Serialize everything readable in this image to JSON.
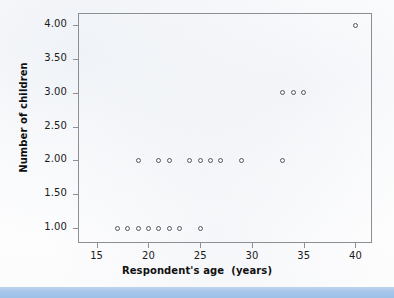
{
  "figure": {
    "background_color": "#ffffff",
    "frame_color": "#8c8f94",
    "marker_color": "#55585e",
    "accent_bar_color": "#a6c6ea"
  },
  "chart_data": {
    "type": "scatter",
    "title": "",
    "xlabel": "Respondent's age  (years)",
    "ylabel": "Number of children",
    "xlim": [
      13.2,
      41.6
    ],
    "ylim": [
      0.78,
      4.18
    ],
    "xticks": [
      15,
      20,
      25,
      30,
      35,
      40
    ],
    "xtick_labels": [
      "15",
      "20",
      "25",
      "30",
      "35",
      "40"
    ],
    "yticks": [
      1.0,
      1.5,
      2.0,
      2.5,
      3.0,
      3.5,
      4.0
    ],
    "ytick_labels": [
      "1.00",
      "1.50",
      "2.00",
      "2.50",
      "3.00",
      "3.50",
      "4.00"
    ],
    "grid": false,
    "legend": null,
    "marker_style": "open-circle",
    "x": [
      17,
      18,
      19,
      20,
      21,
      22,
      23,
      25,
      19,
      21,
      22,
      24,
      25,
      26,
      27,
      29,
      33,
      33,
      34,
      35,
      40
    ],
    "y": [
      1,
      1,
      1,
      1,
      1,
      1,
      1,
      1,
      2,
      2,
      2,
      2,
      2,
      2,
      2,
      2,
      2,
      3,
      3,
      3,
      4
    ],
    "points": [
      {
        "x": 17,
        "y": 1
      },
      {
        "x": 18,
        "y": 1
      },
      {
        "x": 19,
        "y": 1
      },
      {
        "x": 20,
        "y": 1
      },
      {
        "x": 21,
        "y": 1
      },
      {
        "x": 22,
        "y": 1
      },
      {
        "x": 23,
        "y": 1
      },
      {
        "x": 25,
        "y": 1
      },
      {
        "x": 19,
        "y": 2
      },
      {
        "x": 21,
        "y": 2
      },
      {
        "x": 22,
        "y": 2
      },
      {
        "x": 24,
        "y": 2
      },
      {
        "x": 25,
        "y": 2
      },
      {
        "x": 26,
        "y": 2
      },
      {
        "x": 27,
        "y": 2
      },
      {
        "x": 29,
        "y": 2
      },
      {
        "x": 33,
        "y": 2
      },
      {
        "x": 33,
        "y": 3
      },
      {
        "x": 34,
        "y": 3
      },
      {
        "x": 35,
        "y": 3
      },
      {
        "x": 40,
        "y": 4
      }
    ]
  }
}
